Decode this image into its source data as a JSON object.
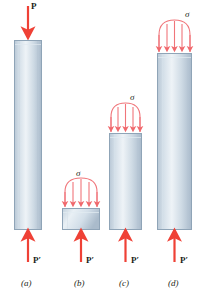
{
  "figure": {
    "type": "engineering-diagram",
    "colors": {
      "arrow_red": "#ef4136",
      "arrow_red_light": "#f0757a",
      "bar_outline": "#8aa0b4",
      "bar_fill_light": "#f2f6f9",
      "bar_fill_mid": "#c9d7e2",
      "bar_fill_dark": "#aebecd",
      "text": "#231f20",
      "background": "#ffffff"
    },
    "panels": [
      {
        "id": "a",
        "caption": "(a)",
        "top_label": "P",
        "top_label_kind": "point-load-down",
        "bottom_label": "P′",
        "bottom_label_kind": "point-load-up",
        "stress_label": "",
        "has_distributed_stress": false,
        "bar": {
          "x": 14,
          "y": 40,
          "width": 28,
          "height": 190
        }
      },
      {
        "id": "b",
        "caption": "(b)",
        "top_label": "",
        "top_label_kind": "distributed-stress-down",
        "bottom_label": "P′",
        "bottom_label_kind": "point-load-up",
        "stress_label": "σ",
        "has_distributed_stress": true,
        "bar": {
          "x": 62,
          "y": 208,
          "width": 38,
          "height": 22
        },
        "stress_arrows": 5
      },
      {
        "id": "c",
        "caption": "(c)",
        "top_label": "",
        "top_label_kind": "distributed-stress-down",
        "bottom_label": "P′",
        "bottom_label_kind": "point-load-up",
        "stress_label": "σ",
        "has_distributed_stress": true,
        "bar": {
          "x": 109,
          "y": 133,
          "width": 33,
          "height": 97
        },
        "stress_arrows": 5
      },
      {
        "id": "d",
        "caption": "(d)",
        "top_label": "",
        "top_label_kind": "distributed-stress-down",
        "bottom_label": "P′",
        "bottom_label_kind": "point-load-up",
        "stress_label": "σ",
        "has_distributed_stress": true,
        "bar": {
          "x": 157,
          "y": 53,
          "width": 35,
          "height": 177
        },
        "stress_arrows": 5
      }
    ]
  }
}
